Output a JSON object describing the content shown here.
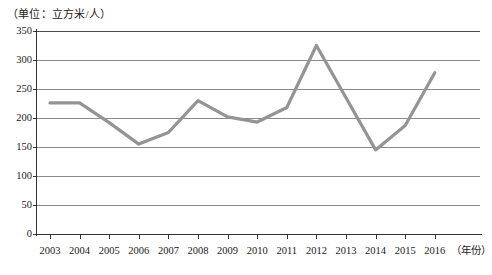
{
  "chart_data": {
    "type": "line",
    "title": "（单位：立方米/人）",
    "xlabel": "（年份）",
    "ylabel": "",
    "categories": [
      "2003",
      "2004",
      "2005",
      "2006",
      "2007",
      "2008",
      "2009",
      "2010",
      "2011",
      "2012",
      "2013",
      "2014",
      "2015",
      "2016"
    ],
    "values": [
      226,
      226,
      192,
      155,
      175,
      230,
      202,
      193,
      218,
      325,
      235,
      145,
      187,
      278
    ],
    "ylim": [
      0,
      350
    ],
    "yticks": [
      0,
      50,
      100,
      150,
      200,
      250,
      300,
      350
    ],
    "grid": true,
    "legend": "none",
    "series": [
      {
        "name": "人均水资源量",
        "color": "#949494",
        "values": [
          226,
          226,
          192,
          155,
          175,
          230,
          202,
          193,
          218,
          325,
          235,
          145,
          187,
          278
        ]
      }
    ]
  },
  "axis": {
    "y_tick_labels": [
      "350",
      "300",
      "250",
      "200",
      "150",
      "100",
      "50",
      "0"
    ],
    "x_tick_labels": [
      "2003",
      "2004",
      "2005",
      "2006",
      "2007",
      "2008",
      "2009",
      "2010",
      "2011",
      "2012",
      "2013",
      "2014",
      "2015",
      "2016"
    ],
    "x_axis_title": "（年份）",
    "unit_label": "（单位：立方米/人）"
  },
  "colors": {
    "line": "#949494",
    "grid": "#8a8a8a",
    "axis": "#333333",
    "background": "#ffffff",
    "text": "#1a1a1a"
  }
}
